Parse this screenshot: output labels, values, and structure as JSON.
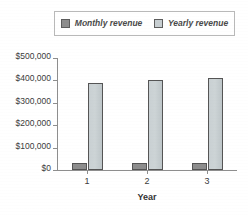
{
  "legend": {
    "position": "top",
    "entries": [
      {
        "label": "Monthly revenue",
        "swatch": "dark-gray-swatch-icon",
        "color": "#8d8d8d"
      },
      {
        "label": "Yearly revenue",
        "swatch": "light-gray-swatch-icon",
        "color": "#c7ced1"
      }
    ]
  },
  "axes": {
    "y_ticks": [
      "$0",
      "$100,000",
      "$200,000",
      "$300,000",
      "$400,000",
      "$500,000"
    ],
    "x_ticks": [
      "1",
      "2",
      "3"
    ],
    "x_title": "Year",
    "y_title": ""
  },
  "chart_data": {
    "type": "bar",
    "title": "",
    "subtitle": "",
    "xlabel": "Year",
    "ylabel": "",
    "categories": [
      "1",
      "2",
      "3"
    ],
    "series": [
      {
        "name": "Monthly revenue",
        "color": "#8d8d8d",
        "values": [
          32000,
          31000,
          30000
        ]
      },
      {
        "name": "Yearly revenue",
        "color": "#c7ced1",
        "values": [
          390000,
          402000,
          412000
        ]
      }
    ],
    "ylim": [
      0,
      500000
    ],
    "ytick_values": [
      0,
      100000,
      200000,
      300000,
      400000,
      500000
    ],
    "ytick_labels": [
      "$0",
      "$100,000",
      "$200,000",
      "$300,000",
      "$400,000",
      "$500,000"
    ],
    "grid": false,
    "legend_position": "top",
    "grouped": true
  }
}
